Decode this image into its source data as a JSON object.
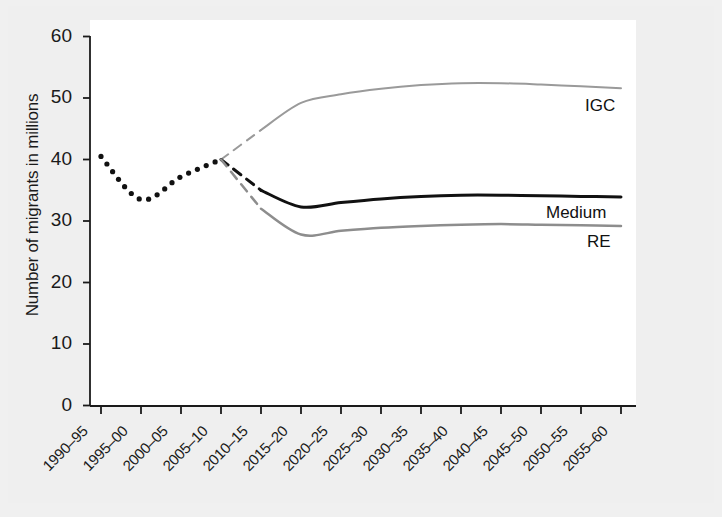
{
  "chart_data": {
    "type": "line",
    "title": "",
    "xlabel": "",
    "ylabel": "Number of migrants in millions",
    "ylim": [
      0,
      60
    ],
    "yticks": [
      0,
      10,
      20,
      30,
      40,
      50,
      60
    ],
    "ytick_labels": [
      "0",
      "10",
      "20",
      "30",
      "40",
      "50",
      "60"
    ],
    "grid": false,
    "legend_position": "inline-right-of-line-ends",
    "categories": [
      "1990–95",
      "1995–00",
      "2000–05",
      "2005–10",
      "2010–15",
      "2015–20",
      "2020–25",
      "2025–30",
      "2030–35",
      "2035–40",
      "2040–45",
      "2045–50",
      "2050–55",
      "2055–60"
    ],
    "series": [
      {
        "name": "Historical",
        "label": "",
        "style": "dotted",
        "color": "#111111",
        "width": 3,
        "values": [
          40.5,
          33.5,
          37.2,
          40.0,
          null,
          null,
          null,
          null,
          null,
          null,
          null,
          null,
          null,
          null
        ]
      },
      {
        "name": "IGC",
        "label": "IGC",
        "style": "solid-with-dashed-lead",
        "color": "#9a9a9a",
        "width": 2,
        "dashed_segment": [
          3,
          4
        ],
        "values": [
          null,
          null,
          null,
          40.0,
          44.8,
          49.2,
          50.6,
          51.5,
          52.1,
          52.4,
          52.4,
          52.2,
          51.9,
          51.6
        ]
      },
      {
        "name": "Medium",
        "label": "Medium",
        "style": "solid-with-dashed-lead",
        "color": "#111111",
        "width": 3,
        "dashed_segment": [
          3,
          4
        ],
        "values": [
          null,
          null,
          null,
          40.0,
          35.0,
          32.3,
          33.0,
          33.6,
          34.0,
          34.2,
          34.2,
          34.1,
          34.0,
          33.9
        ]
      },
      {
        "name": "RE",
        "label": "RE",
        "style": "solid-with-dashed-lead",
        "color": "#8d8d8d",
        "width": 2.5,
        "dashed_segment": [
          3,
          4
        ],
        "values": [
          null,
          null,
          null,
          40.0,
          32.0,
          27.8,
          28.4,
          28.9,
          29.2,
          29.4,
          29.5,
          29.4,
          29.3,
          29.2
        ]
      }
    ],
    "annotations": [
      {
        "text": "IGC",
        "x_category": "2055–60",
        "y": 48.0
      },
      {
        "text": "Medium",
        "x_category": "2055–60",
        "y": 31.5
      },
      {
        "text": "RE",
        "x_category": "2055–60",
        "y": 26.5
      }
    ]
  },
  "colors": {
    "background": "#efefef",
    "plot_background": "#ffffff",
    "axis": "#1a1a1a",
    "historical": "#111111",
    "igc": "#9a9a9a",
    "medium": "#111111",
    "re": "#8d8d8d"
  }
}
